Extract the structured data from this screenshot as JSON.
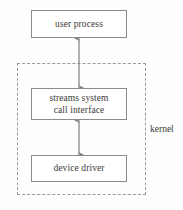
{
  "diagram": {
    "title": "streams",
    "background_color": "#fefefe",
    "line_color": "#8c8c8c",
    "dash_color": "#9a9a9a",
    "text_color": "#3a3a3a",
    "boxes": [
      {
        "id": "user-process",
        "lines": [
          "user process"
        ],
        "x": 31,
        "y": 10,
        "w": 96,
        "h": 28
      },
      {
        "id": "streams-system-call-interface",
        "lines": [
          "streams system",
          "call interface"
        ],
        "x": 31,
        "y": 88,
        "w": 96,
        "h": 32
      },
      {
        "id": "device-driver",
        "lines": [
          "device driver"
        ],
        "x": 31,
        "y": 155,
        "w": 96,
        "h": 27
      }
    ],
    "kernel": {
      "label": "kernel",
      "x": 17,
      "y": 63,
      "w": 129,
      "h": 132,
      "label_x": 150,
      "label_y": 124
    },
    "arrows": [
      {
        "id": "user-process-to-streams",
        "double_headed": true,
        "x": 79,
        "y1": 38,
        "y2": 88
      },
      {
        "id": "streams-to-device-driver",
        "double_headed": true,
        "x": 79,
        "y1": 120,
        "y2": 155
      }
    ]
  }
}
